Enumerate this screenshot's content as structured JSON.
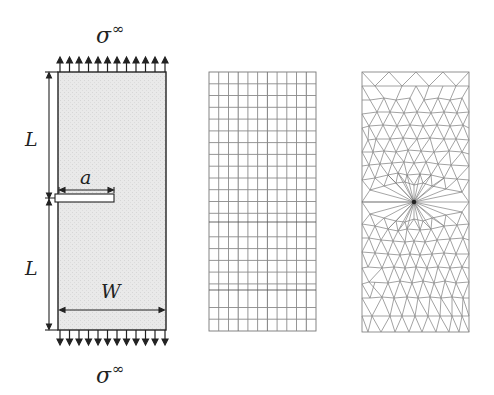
{
  "figure": {
    "panels": [
      {
        "id": "geometry",
        "description": "Plate with edge crack under far-field tension"
      },
      {
        "id": "quad-mesh",
        "description": "Structured quadrilateral mesh",
        "columns": 11,
        "rows": 22
      },
      {
        "id": "tri-mesh",
        "description": "Unstructured triangular mesh refined at crack tip"
      }
    ],
    "labels": {
      "sigma_top": "σ",
      "sigma_top_sup": "∞",
      "sigma_bottom": "σ",
      "sigma_bottom_sup": "∞",
      "length_upper": "L",
      "length_lower": "L",
      "crack_length": "a",
      "width": "W"
    },
    "colors": {
      "plate_fill": "#e6e6e6",
      "line": "#222222",
      "mesh_line": "#8a8a8a"
    },
    "load_arrows": {
      "count": 12
    }
  }
}
